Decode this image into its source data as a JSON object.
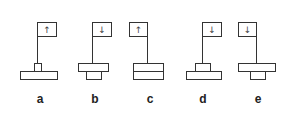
{
  "figures": [
    {
      "label": "a",
      "arrow": "↑",
      "flag_side": "right",
      "top": "small",
      "bottom": "wide"
    },
    {
      "label": "b",
      "arrow": "↓",
      "flag_side": "right",
      "top": "wide",
      "bottom": "small"
    },
    {
      "label": "c",
      "arrow": "↑",
      "flag_side": "left",
      "top": "wide",
      "bottom": "wide"
    },
    {
      "label": "d",
      "arrow": "↓",
      "flag_side": "right",
      "top": "small",
      "bottom": "wide"
    },
    {
      "label": "e",
      "arrow": "↓",
      "flag_side": "left",
      "top": "wide",
      "bottom": "small"
    }
  ],
  "colors": {
    "stroke": "#333333",
    "background": "#ffffff"
  }
}
